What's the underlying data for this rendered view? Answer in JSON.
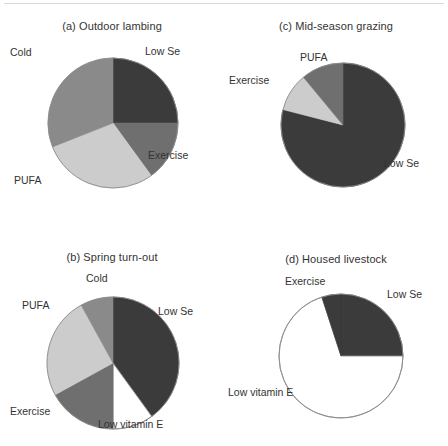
{
  "figure": {
    "background": "#ffffff",
    "divider_color": "#d9d9d9",
    "palette": {
      "low_se": "#3b3b3b",
      "exercise": "#6f6f6f",
      "cold": "#8a8a8a",
      "pufa": "#cccccc",
      "low_vitamin_e": "#ffffff",
      "outline": "#8c8c8c",
      "text": "#333333"
    }
  },
  "panels": [
    {
      "id": "a",
      "title": "(a) Outdoor lambing",
      "labels": [
        {
          "text": "Cold",
          "x": 10,
          "y": 47
        },
        {
          "text": "Low Se",
          "x": 145,
          "y": 46
        },
        {
          "text": "Exercise",
          "x": 148,
          "y": 150
        },
        {
          "text": "PUFA",
          "x": 14,
          "y": 175
        }
      ]
    },
    {
      "id": "b",
      "title": "(b) Spring turn-out",
      "labels": [
        {
          "text": "Cold",
          "x": 86,
          "y": 50
        },
        {
          "text": "PUFA",
          "x": 22,
          "y": 77
        },
        {
          "text": "Low Se",
          "x": 158,
          "y": 83
        },
        {
          "text": "Exercise",
          "x": 10,
          "y": 183
        },
        {
          "text": "Low vitamin E",
          "x": 98,
          "y": 196
        }
      ]
    },
    {
      "id": "c",
      "title": "(c) Mid-season grazing",
      "labels": [
        {
          "text": "PUFA",
          "x": 76,
          "y": 52
        },
        {
          "text": "Exercise",
          "x": 5,
          "y": 75
        },
        {
          "text": "Low Se",
          "x": 160,
          "y": 158
        }
      ]
    },
    {
      "id": "d",
      "title": "(d) Housed livestock",
      "labels": [
        {
          "text": "Exercise",
          "x": 61,
          "y": 53
        },
        {
          "text": "Low Se",
          "x": 163,
          "y": 66
        },
        {
          "text": "Low vitamin E",
          "x": 4,
          "y": 164
        }
      ]
    }
  ],
  "chart_data": [
    {
      "type": "pie",
      "panel": "a",
      "title": "(a) Outdoor lambing",
      "radius_px": 65,
      "start_angle_deg": 0,
      "direction": "clockwise",
      "categories": [
        "Low Se",
        "Exercise",
        "PUFA",
        "Cold"
      ],
      "values": [
        25,
        15,
        29,
        31
      ],
      "unit": "percent",
      "colors": [
        "#3b3b3b",
        "#6f6f6f",
        "#cccccc",
        "#8a8a8a"
      ],
      "legend": "slice labels placed outside pie",
      "grid": false
    },
    {
      "type": "pie",
      "panel": "b",
      "title": "(b) Spring turn-out",
      "radius_px": 66,
      "start_angle_deg": 0,
      "direction": "clockwise",
      "categories": [
        "Low Se",
        "Low vitamin E",
        "Exercise",
        "PUFA",
        "Cold"
      ],
      "values": [
        40,
        10,
        17,
        25,
        8
      ],
      "unit": "percent",
      "colors": [
        "#3b3b3b",
        "#ffffff",
        "#6f6f6f",
        "#cccccc",
        "#8a8a8a"
      ],
      "legend": "slice labels placed outside pie",
      "grid": false
    },
    {
      "type": "pie",
      "panel": "c",
      "title": "(c) Mid-season grazing",
      "radius_px": 62,
      "start_angle_deg": 0,
      "direction": "clockwise",
      "categories": [
        "Low Se",
        "PUFA",
        "Exercise"
      ],
      "values": [
        79,
        10,
        11
      ],
      "unit": "percent",
      "colors": [
        "#3b3b3b",
        "#cccccc",
        "#6f6f6f"
      ],
      "legend": "slice labels placed outside pie",
      "grid": false
    },
    {
      "type": "pie",
      "panel": "d",
      "title": "(d) Housed livestock",
      "radius_px": 62,
      "start_angle_deg": 0,
      "direction": "clockwise",
      "categories": [
        "Low Se",
        "Low vitamin E",
        "Exercise"
      ],
      "values": [
        25,
        70,
        5
      ],
      "unit": "percent",
      "colors": [
        "#3b3b3b",
        "#ffffff",
        "#3b3b3b"
      ],
      "legend": "slice labels placed outside pie",
      "grid": false
    }
  ]
}
